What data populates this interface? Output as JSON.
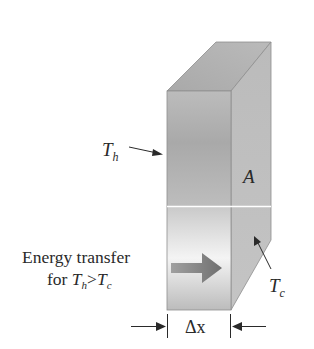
{
  "diagram": {
    "labels": {
      "th": "T",
      "th_sub": "h",
      "area": "A",
      "tc": "T",
      "tc_sub": "c",
      "energy_line1": "Energy transfer",
      "energy_line2_prefix": "for ",
      "energy_line2_t1": "T",
      "energy_line2_t1_sub": "h",
      "energy_line2_op": ">",
      "energy_line2_t2": "T",
      "energy_line2_t2_sub": "c",
      "thickness": "Δx"
    },
    "colors": {
      "front_face_top": "#b5b5b5",
      "front_face_mid": "#a8a8a8",
      "front_face_light": "#f2f2f2",
      "side_face": "#b3b3b3",
      "top_face": "#b0b0b0",
      "edge": "#8e8e8e",
      "divider": "#ffffff",
      "arrow": "#7a7a7a",
      "text": "#2a2a2a"
    }
  }
}
